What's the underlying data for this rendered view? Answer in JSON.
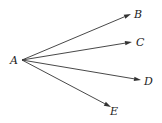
{
  "diagram": {
    "origin": {
      "label": "A",
      "x": 22,
      "y": 60,
      "lx": 10,
      "ly": 64
    },
    "rays": [
      {
        "label": "B",
        "x2": 131,
        "y2": 14,
        "lx": 134,
        "ly": 18
      },
      {
        "label": "C",
        "x2": 132,
        "y2": 42,
        "lx": 136,
        "ly": 46
      },
      {
        "label": "D",
        "x2": 141,
        "y2": 80,
        "lx": 144,
        "ly": 85
      },
      {
        "label": "E",
        "x2": 111,
        "y2": 107,
        "lx": 110,
        "ly": 115
      }
    ],
    "stroke_color": "#333333",
    "background": "#ffffff"
  }
}
